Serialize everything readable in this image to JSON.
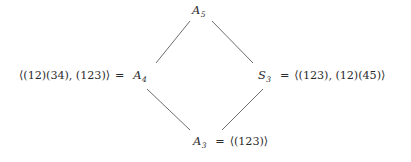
{
  "figure": {
    "kind": "hasse-diagram",
    "background_color": "#ffffff",
    "text_color": "#2b2b2b",
    "edge_color": "#6e6e72"
  },
  "nodes": {
    "top": {
      "id": "A5",
      "symbol": "A",
      "subscript": "5",
      "label": "A5"
    },
    "left": {
      "id": "A4",
      "symbol": "A",
      "subscript": "4",
      "label": "A4",
      "equals": "=",
      "generators": "⟨(12)(34), (123)⟩"
    },
    "right": {
      "id": "S3",
      "symbol": "S",
      "subscript": "3",
      "label": "S3",
      "equals": "=",
      "generators": "⟨(123), (12)(45)⟩"
    },
    "bottom": {
      "id": "A3",
      "symbol": "A",
      "subscript": "3",
      "label": "A3",
      "equals": "=",
      "generators": "⟨(123)⟩"
    }
  },
  "edges": [
    {
      "id": "edge-a4-a5",
      "from": "A4",
      "to": "A5",
      "x1": 156,
      "y1": 63,
      "x2": 190,
      "y2": 21
    },
    {
      "id": "edge-s3-a5",
      "from": "S3",
      "to": "A5",
      "x1": 212,
      "y1": 21,
      "x2": 253,
      "y2": 63
    },
    {
      "id": "edge-a3-a4",
      "from": "A3",
      "to": "A4",
      "x1": 147,
      "y1": 89,
      "x2": 190,
      "y2": 130
    },
    {
      "id": "edge-a3-s3",
      "from": "A3",
      "to": "S3",
      "x1": 222,
      "y1": 130,
      "x2": 263,
      "y2": 89
    }
  ]
}
